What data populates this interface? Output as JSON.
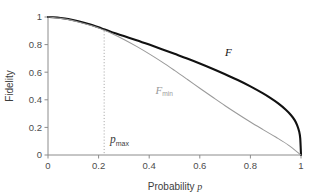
{
  "chart_data": {
    "type": "line",
    "title": "",
    "xlabel": "Probability p",
    "ylabel": "Fidelity",
    "xlim": [
      0,
      1
    ],
    "ylim": [
      0,
      1
    ],
    "grid": false,
    "legend_position": "inline-curve-labels",
    "xticks": [
      0,
      0.2,
      0.4,
      0.6,
      0.8,
      1
    ],
    "xtick_labels": [
      "0",
      "0.2",
      "0.4",
      "0.6",
      "0.8",
      "1"
    ],
    "yticks": [
      0,
      0.2,
      0.4,
      0.6,
      0.8,
      1
    ],
    "ytick_labels": [
      "0",
      "0.2",
      "0.4",
      "0.6",
      "0.8",
      "1"
    ],
    "series": [
      {
        "name": "F",
        "label_text": "F",
        "label_sub": "",
        "color": "#111111",
        "linewidth": 2.1,
        "label_x": 0.7,
        "label_y": 0.72,
        "x": [
          0,
          0.02,
          0.05,
          0.08,
          0.12,
          0.16,
          0.2,
          0.22,
          0.25,
          0.3,
          0.35,
          0.4,
          0.45,
          0.5,
          0.55,
          0.6,
          0.65,
          0.7,
          0.75,
          0.8,
          0.85,
          0.88,
          0.91,
          0.94,
          0.96,
          0.975,
          0.985,
          0.993,
          0.997,
          1
        ],
        "y": [
          1,
          0.998,
          0.993,
          0.985,
          0.969,
          0.95,
          0.926,
          0.912,
          0.892,
          0.862,
          0.832,
          0.8,
          0.767,
          0.733,
          0.699,
          0.663,
          0.625,
          0.585,
          0.543,
          0.497,
          0.446,
          0.412,
          0.374,
          0.328,
          0.29,
          0.253,
          0.215,
          0.168,
          0.12,
          0
        ]
      },
      {
        "name": "F_min",
        "label_text": "F",
        "label_sub": "min",
        "color": "#9a9a9a",
        "linewidth": 1.05,
        "label_x": 0.425,
        "label_y": 0.445,
        "x": [
          0,
          0.02,
          0.05,
          0.08,
          0.12,
          0.16,
          0.2,
          0.22,
          0.25,
          0.3,
          0.35,
          0.4,
          0.45,
          0.5,
          0.55,
          0.6,
          0.65,
          0.7,
          0.75,
          0.8,
          0.85,
          0.9,
          0.95,
          1
        ],
        "y": [
          1,
          0.997,
          0.99,
          0.981,
          0.964,
          0.944,
          0.92,
          0.905,
          0.882,
          0.837,
          0.787,
          0.733,
          0.675,
          0.613,
          0.549,
          0.484,
          0.42,
          0.357,
          0.297,
          0.239,
          0.184,
          0.13,
          0.072,
          0
        ]
      }
    ],
    "annotations": [
      {
        "name": "p_max",
        "label_text": "p",
        "label_sub": "max",
        "x": 0.222,
        "line_style": "dotted",
        "line_color": "#a8a8a8",
        "label_px": 0.245,
        "label_py": 0.085
      }
    ]
  },
  "axes": {
    "y_label": "Fidelity",
    "x_label_prefix": "Probability ",
    "x_label_var": "p",
    "axis_color": "#8c8c8c"
  },
  "colors": {
    "background": "#ffffff",
    "curve_primary": "#111111",
    "curve_secondary": "#9a9a9a",
    "axis": "#8c8c8c",
    "text": "#4a4a4a",
    "guide": "#a8a8a8"
  }
}
